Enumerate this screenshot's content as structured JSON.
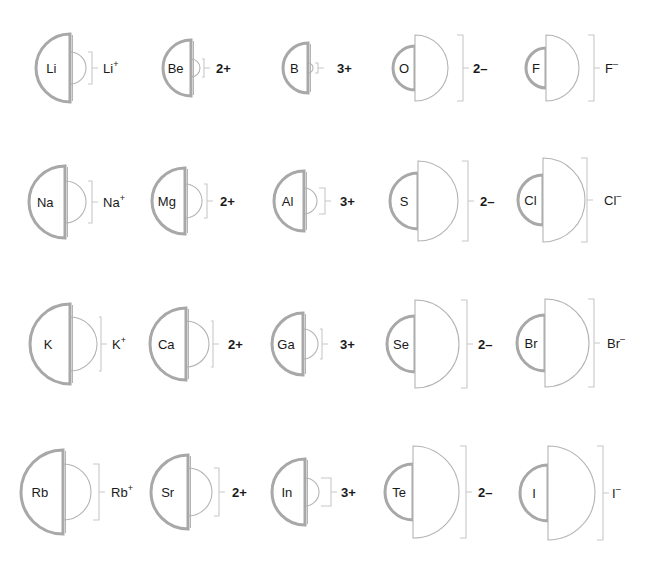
{
  "colors": {
    "background": "#ffffff",
    "atom_outline": "#a8a8a8",
    "ion_outline": "#b4b4b4",
    "bracket": "#c8c8c8",
    "text": "#1a1a1a"
  },
  "legend": {
    "left_half": "neutral atom (thick outline)",
    "right_half": "ion (thin outline)"
  },
  "rows": [
    {
      "period": 2,
      "elements": [
        {
          "symbol": "Li",
          "ion_label": "Li",
          "charge": "+",
          "label_style": "superscript",
          "flat_x": 70,
          "cy": 68,
          "atom_r": 34,
          "ion_r": 16,
          "bracket_x": 92,
          "label_x": 103
        },
        {
          "symbol": "Be",
          "ion_label": "2+",
          "charge": "2+",
          "label_style": "charge",
          "flat_x": 191,
          "cy": 68,
          "atom_r": 28,
          "ion_r": 9,
          "bracket_x": 204,
          "label_x": 216
        },
        {
          "symbol": "B",
          "ion_label": "3+",
          "charge": "3+",
          "label_style": "charge",
          "flat_x": 308,
          "cy": 68,
          "atom_r": 25,
          "ion_r": 5,
          "bracket_x": 318,
          "label_x": 337
        },
        {
          "symbol": "O",
          "ion_label": "2–",
          "charge": "2–",
          "label_style": "charge",
          "flat_x": 415,
          "cy": 68,
          "atom_r": 22,
          "ion_r": 33,
          "bracket_x": 463,
          "label_x": 473
        },
        {
          "symbol": "F",
          "ion_label": "F",
          "charge": "–",
          "label_style": "superscript",
          "flat_x": 546,
          "cy": 68,
          "atom_r": 20,
          "ion_r": 33,
          "bracket_x": 594,
          "label_x": 605
        }
      ]
    },
    {
      "period": 3,
      "elements": [
        {
          "symbol": "Na",
          "ion_label": "Na",
          "charge": "+",
          "label_style": "superscript",
          "flat_x": 65,
          "cy": 202,
          "atom_r": 36,
          "ion_r": 21,
          "bracket_x": 92,
          "label_x": 103
        },
        {
          "symbol": "Mg",
          "ion_label": "2+",
          "charge": "2+",
          "label_style": "charge",
          "flat_x": 185,
          "cy": 201,
          "atom_r": 33,
          "ion_r": 17,
          "bracket_x": 207,
          "label_x": 220
        },
        {
          "symbol": "Al",
          "ion_label": "3+",
          "charge": "3+",
          "label_style": "charge",
          "flat_x": 304,
          "cy": 201,
          "atom_r": 30,
          "ion_r": 13,
          "bracket_x": 325,
          "label_x": 340
        },
        {
          "symbol": "S",
          "ion_label": "2–",
          "charge": "2–",
          "label_style": "charge",
          "flat_x": 418,
          "cy": 201,
          "atom_r": 28,
          "ion_r": 40,
          "bracket_x": 468,
          "label_x": 480
        },
        {
          "symbol": "Cl",
          "ion_label": "Cl",
          "charge": "–",
          "label_style": "superscript",
          "flat_x": 543,
          "cy": 200,
          "atom_r": 25,
          "ion_r": 42,
          "bracket_x": 587,
          "label_x": 604
        }
      ]
    },
    {
      "period": 4,
      "elements": [
        {
          "symbol": "K",
          "ion_label": "K",
          "charge": "+",
          "label_style": "superscript",
          "flat_x": 70,
          "cy": 344,
          "atom_r": 40,
          "ion_r": 27,
          "bracket_x": 101,
          "label_x": 112
        },
        {
          "symbol": "Ca",
          "ion_label": "2+",
          "charge": "2+",
          "label_style": "charge",
          "flat_x": 186,
          "cy": 344,
          "atom_r": 36,
          "ion_r": 23,
          "bracket_x": 213,
          "label_x": 228
        },
        {
          "symbol": "Ga",
          "ion_label": "3+",
          "charge": "3+",
          "label_style": "charge",
          "flat_x": 303,
          "cy": 344,
          "atom_r": 31,
          "ion_r": 15,
          "bracket_x": 322,
          "label_x": 340
        },
        {
          "symbol": "Se",
          "ion_label": "2–",
          "charge": "2–",
          "label_style": "charge",
          "flat_x": 415,
          "cy": 344,
          "atom_r": 28,
          "ion_r": 44,
          "bracket_x": 467,
          "label_x": 478
        },
        {
          "symbol": "Br",
          "ion_label": "Br",
          "charge": "–",
          "label_style": "superscript",
          "flat_x": 545,
          "cy": 343,
          "atom_r": 28,
          "ion_r": 44,
          "bracket_x": 594,
          "label_x": 607
        }
      ]
    },
    {
      "period": 5,
      "elements": [
        {
          "symbol": "Rb",
          "ion_label": "Rb",
          "charge": "+",
          "label_style": "superscript",
          "flat_x": 63,
          "cy": 492,
          "atom_r": 42,
          "ion_r": 28,
          "bracket_x": 99,
          "label_x": 111
        },
        {
          "symbol": "Sr",
          "ion_label": "2+",
          "charge": "2+",
          "label_style": "charge",
          "flat_x": 188,
          "cy": 492,
          "atom_r": 37,
          "ion_r": 24,
          "bracket_x": 219,
          "label_x": 232
        },
        {
          "symbol": "In",
          "ion_label": "3+",
          "charge": "3+",
          "label_style": "charge",
          "flat_x": 305,
          "cy": 492,
          "atom_r": 33,
          "ion_r": 14,
          "bracket_x": 331,
          "label_x": 341
        },
        {
          "symbol": "Te",
          "ion_label": "2–",
          "charge": "2–",
          "label_style": "charge",
          "flat_x": 413,
          "cy": 492,
          "atom_r": 28,
          "ion_r": 46,
          "bracket_x": 466,
          "label_x": 478
        },
        {
          "symbol": "I",
          "ion_label": "I",
          "charge": "–",
          "label_style": "superscript",
          "flat_x": 548,
          "cy": 493,
          "atom_r": 28,
          "ion_r": 47,
          "bracket_x": 603,
          "label_x": 612
        }
      ]
    }
  ]
}
